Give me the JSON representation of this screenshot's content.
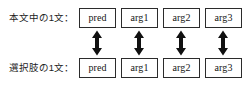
{
  "figure": {
    "colors": {
      "background": "#ffffff",
      "box_border": "#2b2b2b",
      "box_fill": "#ffffff",
      "text": "#141414",
      "arrow": "#111111"
    }
  },
  "rows": [
    {
      "label": "本文中の1文：",
      "boxes": [
        {
          "label": "pred"
        },
        {
          "label": "arg1"
        },
        {
          "label": "arg2"
        },
        {
          "label": "arg3"
        }
      ]
    },
    {
      "label": "選択肢の1文：",
      "boxes": [
        {
          "label": "pred"
        },
        {
          "label": "arg1"
        },
        {
          "label": "arg2"
        },
        {
          "label": "arg3"
        }
      ]
    }
  ],
  "connectors": [
    {
      "name": "pred",
      "type": "double-headed-vertical-arrow"
    },
    {
      "name": "arg1",
      "type": "double-headed-vertical-arrow"
    },
    {
      "name": "arg2",
      "type": "double-headed-vertical-arrow"
    },
    {
      "name": "arg3",
      "type": "double-headed-vertical-arrow"
    }
  ]
}
